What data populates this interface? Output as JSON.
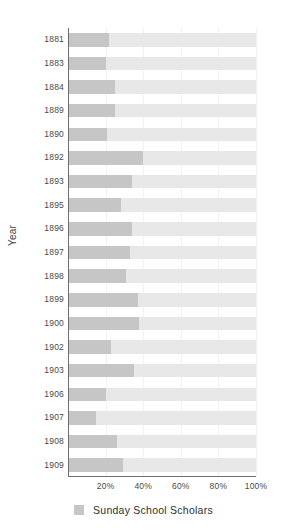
{
  "chart_data": {
    "type": "bar",
    "orientation": "horizontal",
    "title": "",
    "xlabel": "",
    "ylabel": "Year",
    "xlim": [
      0,
      100
    ],
    "xticks": [
      20,
      40,
      60,
      80,
      100
    ],
    "xtick_labels": [
      "20%",
      "40%",
      "60%",
      "80%",
      "100%"
    ],
    "grid": true,
    "grid_axis": "x",
    "legend_position": "bottom-center",
    "categories": [
      "1881",
      "1883",
      "1884",
      "1889",
      "1890",
      "1892",
      "1893",
      "1895",
      "1896",
      "1897",
      "1898",
      "1899",
      "1900",
      "1902",
      "1903",
      "1906",
      "1907",
      "1908",
      "1909"
    ],
    "series": [
      {
        "name": "Sunday School Scholars",
        "color": "#c6c6c6",
        "track_color": "#e8e8e8",
        "unit": "%",
        "values": [
          22,
          20,
          25,
          25,
          21,
          40,
          34,
          28,
          34,
          33,
          31,
          37,
          38,
          23,
          35,
          20,
          15,
          26,
          29
        ]
      }
    ]
  },
  "legend": {
    "items": [
      {
        "label": "Sunday School Scholars",
        "color": "#c6c6c6"
      }
    ]
  },
  "axis": {
    "y_title": "Year"
  }
}
